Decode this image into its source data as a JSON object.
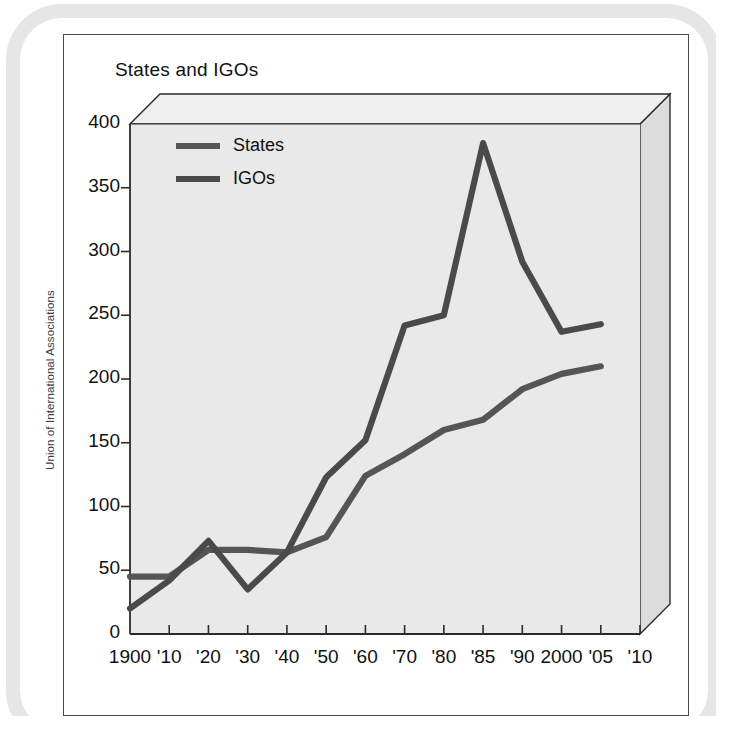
{
  "figure": {
    "title": "States and IGOs",
    "source_credit": "Union of International Associations"
  },
  "chart_data": {
    "type": "line",
    "title": "States and IGOs",
    "xlabel": "",
    "ylabel": "",
    "ylim": [
      0,
      400
    ],
    "ytick_step": 50,
    "grid": false,
    "legend_position": "top-left inside plot",
    "categories": [
      "1900",
      "'10",
      "'20",
      "'30",
      "'40",
      "'50",
      "'60",
      "'70",
      "'80",
      "'85",
      "'90",
      "2000",
      "'05",
      "'10"
    ],
    "xtick_labels": [
      "1900",
      "'10",
      "'20",
      "'30",
      "'40",
      "'50",
      "'60",
      "'70",
      "'80",
      "'85",
      "'90",
      "2000",
      "'05",
      "'10"
    ],
    "ytick_labels": [
      "0",
      "50",
      "100",
      "150",
      "200",
      "250",
      "300",
      "350",
      "400"
    ],
    "ytick_values": [
      0,
      50,
      100,
      150,
      200,
      250,
      300,
      350,
      400
    ],
    "series": [
      {
        "name": "States",
        "color": "#555555",
        "x": [
          "1900",
          "'10",
          "'20",
          "'30",
          "'40",
          "'50",
          "'60",
          "'70",
          "'80",
          "'85",
          "'90",
          "2000",
          "'05"
        ],
        "values": [
          45,
          45,
          66,
          66,
          64,
          76,
          124,
          141,
          160,
          168,
          192,
          204,
          210
        ]
      },
      {
        "name": "IGOs",
        "color": "#4a4a4a",
        "x": [
          "1900",
          "'10",
          "'20",
          "'30",
          "'40",
          "'50",
          "'60",
          "'70",
          "'80",
          "'85",
          "'90",
          "2000",
          "'05"
        ],
        "values": [
          20,
          42,
          73,
          35,
          64,
          123,
          152,
          242,
          250,
          385,
          292,
          237,
          243
        ]
      }
    ],
    "annotations": []
  },
  "legend": {
    "items": [
      {
        "label": "States",
        "color": "#555555"
      },
      {
        "label": "IGOs",
        "color": "#4a4a4a"
      }
    ]
  },
  "style": {
    "plot_background": "#e9e9e9",
    "box_face": "#e4e4e4",
    "box_top": "#efefef",
    "box_side": "#dcdcdc",
    "axis_color": "#2b2b2b",
    "card_background": "#ffffff",
    "deco_band": "#e6e6e6"
  }
}
